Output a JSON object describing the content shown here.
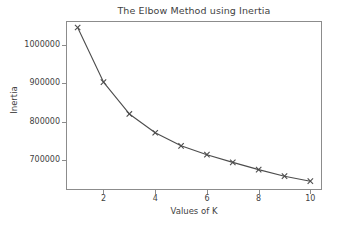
{
  "chart_data": {
    "type": "line",
    "title": "The Elbow Method using Inertia",
    "xlabel": "Values of K",
    "ylabel": "Inertia",
    "x": [
      1,
      2,
      3,
      4,
      5,
      6,
      7,
      8,
      9,
      10
    ],
    "values": [
      1045000,
      903000,
      820000,
      771000,
      737000,
      714000,
      694000,
      675000,
      658000,
      645000
    ],
    "series": [
      {
        "name": "Inertia",
        "values": [
          1045000,
          903000,
          820000,
          771000,
          737000,
          714000,
          694000,
          675000,
          658000,
          645000
        ]
      }
    ],
    "xlim": [
      0.55,
      10.45
    ],
    "ylim": [
      622000,
      1062000
    ],
    "xticks": [
      2,
      4,
      6,
      8,
      10
    ],
    "xtick_labels": [
      "2",
      "4",
      "6",
      "8",
      "10"
    ],
    "yticks": [
      700000,
      800000,
      900000,
      1000000
    ],
    "ytick_labels": [
      "700000",
      "800000",
      "900000",
      "1000000"
    ],
    "grid": false,
    "legend": null,
    "marker": "x",
    "line_color": "#4d4d4d",
    "marker_color": "#4d4d4d",
    "frame_color": "#8c8c8c",
    "background": "#ffffff"
  }
}
